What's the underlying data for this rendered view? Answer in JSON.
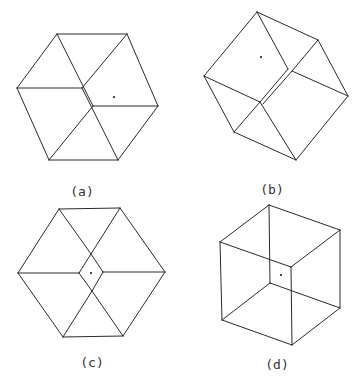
{
  "figure": {
    "stroke_color": "#2a2a2a",
    "panels": [
      {
        "id": "a",
        "label": "(a)",
        "label_pos": [
          82,
          192
        ],
        "dot": [
          114,
          97
        ],
        "edges": [
          [
            [
              57,
              34
            ],
            [
              127,
              34
            ]
          ],
          [
            [
              57,
              34
            ],
            [
              17,
              88
            ]
          ],
          [
            [
              127,
              34
            ],
            [
              158,
              106
            ]
          ],
          [
            [
              17,
              88
            ],
            [
              49,
              160
            ]
          ],
          [
            [
              158,
              106
            ],
            [
              118,
              160
            ]
          ],
          [
            [
              49,
              160
            ],
            [
              118,
              160
            ]
          ],
          [
            [
              17,
              88
            ],
            [
              82,
              88
            ]
          ],
          [
            [
              127,
              34
            ],
            [
              82,
              88
            ]
          ],
          [
            [
              57,
              34
            ],
            [
              93,
              106
            ]
          ],
          [
            [
              82,
              88
            ],
            [
              118,
              160
            ]
          ],
          [
            [
              93,
              106
            ],
            [
              158,
              106
            ]
          ],
          [
            [
              93,
              106
            ],
            [
              49,
              160
            ]
          ]
        ]
      },
      {
        "id": "b",
        "label": "(b)",
        "label_pos": [
          272,
          190
        ],
        "dot": [
          261,
          57
        ],
        "edges": [
          [
            [
              257,
              12
            ],
            [
              318,
              40
            ]
          ],
          [
            [
              257,
              12
            ],
            [
              204,
              76
            ]
          ],
          [
            [
              318,
              40
            ],
            [
              348,
              96
            ]
          ],
          [
            [
              204,
              76
            ],
            [
              234,
              132
            ]
          ],
          [
            [
              348,
              96
            ],
            [
              296,
              160
            ]
          ],
          [
            [
              234,
              132
            ],
            [
              296,
              160
            ]
          ],
          [
            [
              257,
              12
            ],
            [
              288,
              69
            ]
          ],
          [
            [
              318,
              40
            ],
            [
              292,
              71
            ]
          ],
          [
            [
              292,
              71
            ],
            [
              348,
              96
            ]
          ],
          [
            [
              204,
              76
            ],
            [
              260,
              102
            ]
          ],
          [
            [
              260,
              102
            ],
            [
              296,
              160
            ]
          ],
          [
            [
              292,
              71
            ],
            [
              263,
              104
            ]
          ],
          [
            [
              288,
              69
            ],
            [
              260,
              102
            ]
          ],
          [
            [
              234,
              132
            ],
            [
              260,
              102
            ]
          ]
        ]
      },
      {
        "id": "c",
        "label": "(c)",
        "label_pos": [
          92,
          363
        ],
        "dot": [
          91,
          273
        ],
        "edges": [
          [
            [
              59,
              209
            ],
            [
              120,
              208
            ]
          ],
          [
            [
              59,
              209
            ],
            [
              18,
              273
            ]
          ],
          [
            [
              120,
              208
            ],
            [
              165,
              272
            ]
          ],
          [
            [
              18,
              273
            ],
            [
              63,
              337
            ]
          ],
          [
            [
              165,
              272
            ],
            [
              123,
              336
            ]
          ],
          [
            [
              63,
              337
            ],
            [
              123,
              336
            ]
          ],
          [
            [
              59,
              209
            ],
            [
              91,
              254
            ]
          ],
          [
            [
              120,
              208
            ],
            [
              91,
              254
            ]
          ],
          [
            [
              18,
              273
            ],
            [
              79,
              273
            ]
          ],
          [
            [
              165,
              272
            ],
            [
              103,
              272
            ]
          ],
          [
            [
              63,
              337
            ],
            [
              92,
              291
            ]
          ],
          [
            [
              123,
              336
            ],
            [
              92,
              291
            ]
          ],
          [
            [
              91,
              254
            ],
            [
              79,
              273
            ]
          ],
          [
            [
              91,
              254
            ],
            [
              103,
              272
            ]
          ],
          [
            [
              92,
              291
            ],
            [
              79,
              273
            ]
          ],
          [
            [
              92,
              291
            ],
            [
              103,
              272
            ]
          ]
        ]
      },
      {
        "id": "d",
        "label": "(d)",
        "label_pos": [
          277,
          365
        ],
        "dot": [
          281,
          275
        ],
        "edges": [
          [
            [
              269,
              205
            ],
            [
              340,
              230
            ]
          ],
          [
            [
              269,
              205
            ],
            [
              220,
              242
            ]
          ],
          [
            [
              269,
              205
            ],
            [
              270,
              283
            ]
          ],
          [
            [
              220,
              242
            ],
            [
              291,
              267
            ]
          ],
          [
            [
              340,
              230
            ],
            [
              291,
              267
            ]
          ],
          [
            [
              220,
              242
            ],
            [
              222,
              320
            ]
          ],
          [
            [
              340,
              230
            ],
            [
              340,
              308
            ]
          ],
          [
            [
              291,
              267
            ],
            [
              292,
              345
            ]
          ],
          [
            [
              270,
              283
            ],
            [
              222,
              320
            ]
          ],
          [
            [
              270,
              283
            ],
            [
              340,
              308
            ]
          ],
          [
            [
              222,
              320
            ],
            [
              292,
              345
            ]
          ],
          [
            [
              292,
              345
            ],
            [
              340,
              308
            ]
          ]
        ]
      }
    ]
  }
}
